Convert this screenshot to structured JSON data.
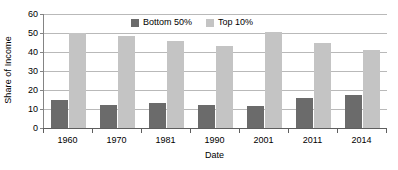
{
  "chart_data": {
    "type": "bar",
    "title": "",
    "xlabel": "Date",
    "ylabel": "Share of Income",
    "categories": [
      "1960",
      "1970",
      "1981",
      "1990",
      "2001",
      "2011",
      "2014"
    ],
    "series": [
      {
        "name": "Bottom 50%",
        "color": "#6b6b6b",
        "values": [
          14.5,
          12,
          13.3,
          12.2,
          11.5,
          16,
          17.5
        ]
      },
      {
        "name": "Top 10%",
        "color": "#c4c4c4",
        "values": [
          49.8,
          48.5,
          46,
          43.4,
          50.5,
          44.5,
          41
        ]
      }
    ],
    "ylim": [
      0,
      60
    ],
    "yticks": [
      0,
      10,
      20,
      30,
      40,
      50,
      60
    ],
    "ytick_labels": [
      "0",
      "10",
      "20",
      "30",
      "40",
      "50",
      "60"
    ],
    "grid": true,
    "grid_axis": "y",
    "legend_position": "top-center",
    "legend": [
      "Bottom 50%",
      "Top 10%"
    ],
    "colors": {
      "series_bottom": "#6b6b6b",
      "series_top": "#c4c4c4",
      "gridline": "#b9b9b9",
      "axis": "#5e5e5e",
      "background": "#ffffff"
    }
  }
}
